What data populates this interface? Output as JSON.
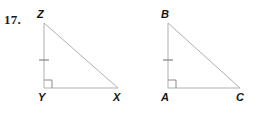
{
  "problem": {
    "number_label": "17."
  },
  "figure": {
    "background_color": "#ffffff",
    "stroke_color": "#b0b0b0",
    "mark_color": "#8a8a8a",
    "label_color": "#141414",
    "stroke_width": 1,
    "figure_type": "two-congruent-right-triangles"
  },
  "triangles": [
    {
      "name": "triangle-zyx",
      "vertices": {
        "apex": {
          "label": "Z",
          "x": 44,
          "y": 23
        },
        "right_angle": {
          "label": "Y",
          "x": 44,
          "y": 88
        },
        "base_end": {
          "label": "X",
          "x": 118,
          "y": 88
        }
      },
      "labels": {
        "apex": {
          "text": "Z",
          "left": 37,
          "top": 9
        },
        "right_angle": {
          "text": "Y",
          "left": 38,
          "top": 92
        },
        "base_end": {
          "text": "X",
          "left": 113,
          "top": 92
        }
      },
      "right_angle_marker": {
        "at": "Y",
        "size": 8
      },
      "tick_marks": [
        {
          "on_side": "ZY",
          "count": 1,
          "x": 44,
          "y": 60,
          "half_length": 5
        }
      ]
    },
    {
      "name": "triangle-bac",
      "vertices": {
        "apex": {
          "label": "B",
          "x": 168,
          "y": 23
        },
        "right_angle": {
          "label": "A",
          "x": 168,
          "y": 88
        },
        "base_end": {
          "label": "C",
          "x": 240,
          "y": 88
        }
      },
      "labels": {
        "apex": {
          "text": "B",
          "left": 161,
          "top": 9
        },
        "right_angle": {
          "text": "A",
          "left": 161,
          "top": 92
        },
        "base_end": {
          "text": "C",
          "left": 236,
          "top": 92
        }
      },
      "right_angle_marker": {
        "at": "A",
        "size": 8
      },
      "tick_marks": [
        {
          "on_side": "BA",
          "count": 1,
          "x": 168,
          "y": 60,
          "half_length": 5
        }
      ]
    }
  ]
}
